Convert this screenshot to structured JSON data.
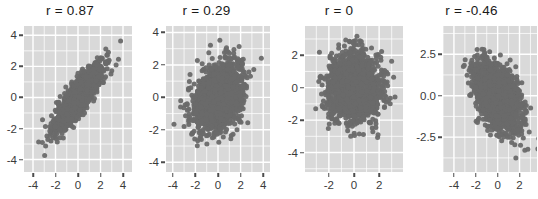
{
  "figure": {
    "kind": "scatterplot-matrix-row",
    "panel_count": 4,
    "point_color": "#6a6a6a",
    "panel_background": "#d9d9d9",
    "gridline_color": "#ffffff",
    "page_background": "#ffffff"
  },
  "chart_data": [
    {
      "type": "scatter",
      "title": "r = 0.87",
      "correlation": 0.87,
      "n_points": 2000,
      "xlabel": "",
      "ylabel": "",
      "grid": true,
      "legend": "none",
      "xlim": [
        -4.8,
        4.8
      ],
      "ylim": [
        -4.8,
        4.6
      ],
      "xticks": [
        -4,
        -2,
        0,
        2,
        4
      ],
      "xticklabels": [
        "-4",
        "-2",
        "0",
        "2",
        "4"
      ],
      "yticks": [
        -4,
        -2,
        0,
        2,
        4
      ],
      "yticklabels": [
        "-4",
        "-2",
        "0",
        "2",
        "4"
      ]
    },
    {
      "type": "scatter",
      "title": "r = 0.29",
      "correlation": 0.29,
      "n_points": 2000,
      "xlabel": "",
      "ylabel": "",
      "grid": true,
      "legend": "none",
      "xlim": [
        -4.6,
        4.6
      ],
      "ylim": [
        -4.6,
        4.4
      ],
      "xticks": [
        -4,
        -2,
        0,
        2,
        4
      ],
      "xticklabels": [
        "-4",
        "-2",
        "0",
        "2",
        "4"
      ],
      "yticks": [
        -4,
        -2,
        0,
        2,
        4
      ],
      "yticklabels": [
        "-4",
        "-2",
        "0",
        "2",
        "4"
      ]
    },
    {
      "type": "scatter",
      "title": "r = 0",
      "correlation": 0.0,
      "n_points": 2000,
      "xlabel": "",
      "ylabel": "",
      "grid": true,
      "legend": "none",
      "xlim": [
        -3.9,
        3.9
      ],
      "ylim": [
        -5.2,
        3.8
      ],
      "xticks": [
        -2,
        0,
        2
      ],
      "xticklabels": [
        "-2",
        "0",
        "2"
      ],
      "yticks": [
        -4,
        -2,
        0,
        2
      ],
      "yticklabels": [
        "-4",
        "-2",
        "0",
        "2"
      ]
    },
    {
      "type": "scatter",
      "title": "r = -0.46",
      "correlation": -0.46,
      "n_points": 2000,
      "xlabel": "",
      "ylabel": "",
      "grid": true,
      "legend": "none",
      "xlim": [
        -5.0,
        3.6
      ],
      "ylim": [
        -4.6,
        4.2
      ],
      "xticks": [
        -4,
        -2,
        0,
        2
      ],
      "xticklabels": [
        "-4",
        "-2",
        "0",
        "2"
      ],
      "yticks": [
        -2.5,
        0.0,
        2.5
      ],
      "yticklabels": [
        "-2.5",
        "0.0",
        "2.5"
      ]
    }
  ],
  "layout": {
    "panels": [
      {
        "wrap_width": 140,
        "plot_left": 24,
        "plot_top": 26,
        "plot_width": 108,
        "plot_height": 146
      },
      {
        "wrap_width": 133,
        "plot_left": 26,
        "plot_top": 26,
        "plot_width": 104,
        "plot_height": 146
      },
      {
        "wrap_width": 132,
        "plot_left": 32,
        "plot_top": 26,
        "plot_width": 98,
        "plot_height": 146
      },
      {
        "wrap_width": 133,
        "plot_left": 38,
        "plot_top": 26,
        "plot_width": 94,
        "plot_height": 146
      }
    ]
  }
}
